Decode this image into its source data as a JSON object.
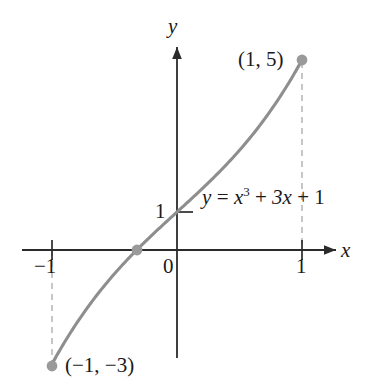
{
  "figure": {
    "title": "",
    "background_color": "#ffffff",
    "width": 368,
    "height": 386
  },
  "axes": {
    "x_axis_label": "x",
    "y_axis_label": "y",
    "origin_label": "0",
    "y_tick_label": "1",
    "x_tick_label_negative": "−1",
    "x_tick_label_positive": "1",
    "axis_color": "#2b2b2b"
  },
  "annotations": {
    "point_label_max": "(1, 5)",
    "point_label_min": "(−1, −3)",
    "equation": {
      "lhs": "y",
      "equals": "=",
      "term1_base": "x",
      "term1_exp": "3",
      "plus1": "+",
      "term2": "3x",
      "plus2": "+",
      "term3": "1",
      "full_text": "y = x³ + 3x + 1"
    }
  },
  "colors": {
    "curve": "#8e8e8e",
    "point": "#9a9a9a",
    "dashed": "#b8b8b8",
    "axis": "#2b2b2b",
    "text": "#1a1a1a"
  },
  "chart_data": {
    "type": "line",
    "title": "",
    "xlabel": "x",
    "ylabel": "y",
    "equation": "y = x^3 + 3x + 1",
    "xlim": [
      -1.25,
      1.27
    ],
    "ylim": [
      -3.2,
      5.45
    ],
    "grid": false,
    "legend": null,
    "x_ticks": [
      -1,
      0,
      1
    ],
    "x_tick_labels": [
      "−1",
      "0",
      "1"
    ],
    "y_ticks": [
      1
    ],
    "y_tick_labels": [
      "1"
    ],
    "series": [
      {
        "name": "y = x^3 + 3x + 1",
        "x": [
          -1.0,
          -0.9,
          -0.8,
          -0.7,
          -0.6,
          -0.5,
          -0.4,
          -0.3,
          -0.2,
          -0.1,
          0.0,
          0.1,
          0.2,
          0.3,
          0.4,
          0.5,
          0.6,
          0.7,
          0.8,
          0.9,
          1.0
        ],
        "y": [
          -3.0,
          -2.429,
          -2.912,
          -2.443,
          -2.016,
          -1.625,
          -1.264,
          -0.927,
          -0.608,
          -0.301,
          1.0,
          1.301,
          1.608,
          1.927,
          2.264,
          2.625,
          3.016,
          3.443,
          3.912,
          4.429,
          5.0
        ],
        "y_exact": [
          -3.0,
          -2.429,
          -1.912,
          -1.443,
          -1.016,
          -0.625,
          -0.264,
          0.073,
          0.392,
          0.699,
          1.0,
          1.301,
          1.608,
          1.927,
          2.264,
          2.625,
          3.016,
          3.443,
          3.912,
          4.429,
          5.0
        ]
      }
    ],
    "marked_points": [
      {
        "label": "(1, 5)",
        "x": 1,
        "y": 5
      },
      {
        "label": "(−1, −3)",
        "x": -1,
        "y": -3
      },
      {
        "label": "",
        "x": -0.3222,
        "y": 0
      }
    ],
    "dashed_droplines": [
      {
        "x": 1,
        "from_y": 5,
        "to_y": 0
      },
      {
        "x": -1,
        "from_y": 0,
        "to_y": -3
      }
    ]
  }
}
